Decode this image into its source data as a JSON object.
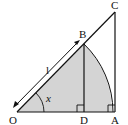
{
  "diagram": {
    "type": "geometry",
    "colors": {
      "stroke": "#111111",
      "fill_sector": "#d4d4d4",
      "background": "#ffffff"
    },
    "points": {
      "O": {
        "label": "O"
      },
      "D": {
        "label": "D"
      },
      "A": {
        "label": "A"
      },
      "B": {
        "label": "B"
      },
      "C": {
        "label": "C"
      }
    },
    "labels": {
      "length": "l",
      "angle": "x"
    },
    "right_angles": [
      "D",
      "A"
    ],
    "segments": [
      "OA",
      "OC",
      "AC",
      "BD"
    ],
    "arcs": [
      "BA (centered at O)",
      "angle x at O"
    ]
  }
}
